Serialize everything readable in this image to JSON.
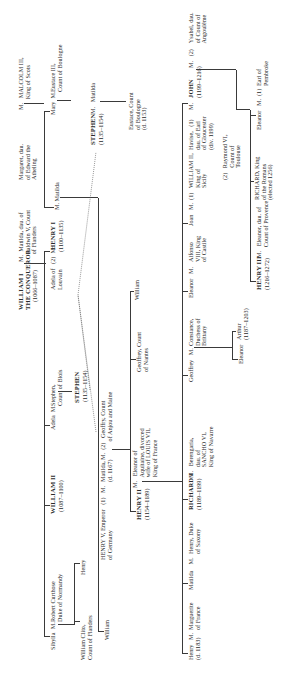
{
  "chart_title": "",
  "people": {
    "william_i": {
      "name": "WILLIAM I\nTHE CONQUEROR",
      "dates": "(1066–1087)"
    },
    "william_i_spouse": "M.  Matilda, dau. of\n     Baldwin V, Count\n     of Flanders",
    "sibylla": "Sibylla  M.",
    "robert_curthose": "Robert Curthose\nDuke of Normandy",
    "william_clito": "William Clito,\nCount of Flanders",
    "henry_clito": "Henry",
    "william_ii": {
      "name": "WILLIAM II",
      "dates": "(1087–1100)"
    },
    "adela": "Adela  M.",
    "stephen_blois": "Stephen,\nCount of Blois",
    "stephen_king": {
      "name": "STEPHEN",
      "dates": "(1135–1154)"
    },
    "adela_louvain": "Adela of   (2)  M.\nLouvain",
    "henry_i": {
      "name": "HENRY I",
      "dates": "(1100–1135)"
    },
    "henry_i_spouse": "M. Matilda",
    "margaret": "Margaret, dau.\nof Edward the\nAtheling",
    "malcolm": "M.   MALCOLM III,\n       King of Scots",
    "mary": "Mary  M.",
    "eustace_iii": "Eustace III,\nCount of Boulogne",
    "stephen_top": {
      "name": "STEPHEN",
      "dates": "(1135–1154)",
      "spouse": "M.   Matilda"
    },
    "eustace_boulogne": "Eustace, Count\nof Boulogne\n(d. 1153)",
    "william_henryv": "William",
    "henry_v": "HENRY V, Emperor   (1)   M.\nof Germany",
    "matilda_empress": "Matilda,\n(d. 1167)",
    "geoffrey_anjou": "M.  (2)   Geoffry, Count\n            of Anjou and Maine",
    "william_geoffrey": "William",
    "geoffrey_nantes": "Geoffrey, Count\nof Nantes",
    "henry_ii": {
      "name": "HENRY II",
      "dates": "(1154–1189)"
    },
    "eleanor_aquitaine": "M.   Eleanor of\n       Aquitaine, divorced\n       wife of LOUIS VII,\n       King of France",
    "henry_young": "Henry   M.\n(d. 1183)",
    "marguerite": "Marguerite\nof France",
    "matilda_saxony": "Matilda    M.",
    "henry_saxony": "Henry, Duke\nof Saxony",
    "richard_i": {
      "name": "RICHARD I",
      "dates": "(1189–1199)"
    },
    "berengaria": "M.   Berengaria,\n       dau. of\n       SANCHO VI,\n       King of Navarre",
    "geoffrey_brittany": "Geoffrey   M.",
    "constance": "Constance,\nDuchess of\nBrittany",
    "eleanor_brittany": "Eleanor",
    "arthur": "Arthur\n(1187–1203)",
    "eleanor_castile": "Eleanor   M.",
    "alfonso": "Alfonso\nVIII, King\nof Castile",
    "joan": "Joan   M.  (1)",
    "william_sicily": "WILLIAM II,\nKing of\nSicily",
    "raymond": "(2)   Raymond VI,\n        Count of\n        Toulouse",
    "havise": "Havise,   (1)\ndau. of Earl\nof Gloucester\n(div. 1199)",
    "john": {
      "name": "JOHN",
      "dates": "(1199–1216)",
      "prefix": "M."
    },
    "ysabel": "M.   (2)    Ysabel, dau.\n                of Count of\n                Angoulême",
    "henry_iii": {
      "name": "HENRY III",
      "dates": "(1216–1272)"
    },
    "eleanor_provence": "M.   Eleanor, dau. of\n       Count of Provence",
    "richard_romans": "RICHARD, King\nof the Romans\n(elected 1256)",
    "eleanor_john": "Eleanor   M.  (1)",
    "pembroke": "Earl of\nPembroke"
  },
  "colors": {
    "line": "#3a3a3a",
    "text": "#2a2a2a",
    "background": "#ffffff"
  }
}
